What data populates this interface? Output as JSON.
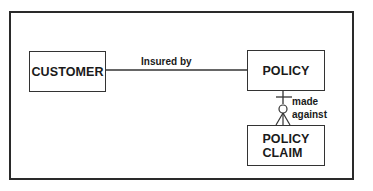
{
  "diagram": {
    "type": "entity-relationship",
    "entities": [
      {
        "id": "customer",
        "label": "CUSTOMER"
      },
      {
        "id": "policy",
        "label": "POLICY"
      },
      {
        "id": "policy_claim",
        "label": "POLICY\nCLAIM"
      }
    ],
    "relationships": [
      {
        "from": "customer",
        "to": "policy",
        "label": "Insured by",
        "notation": "plain line"
      },
      {
        "from": "policy",
        "to": "policy_claim",
        "label_line1": "made",
        "label_line2": "against",
        "notation": "one (bar) at POLICY end, zero-or-many (circle + crow's foot) at POLICY CLAIM end"
      }
    ]
  },
  "colors": {
    "line": "#333333",
    "frame": "#2a2a2a",
    "text": "#1a1a1a",
    "background": "#ffffff"
  }
}
